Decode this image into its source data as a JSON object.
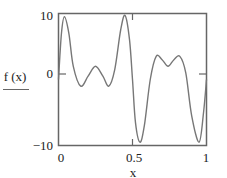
{
  "chart_data": {
    "type": "line",
    "title": "",
    "xlabel": "x",
    "ylabel": "f (x)",
    "xlim": [
      0,
      1
    ],
    "ylim": [
      -10,
      10
    ],
    "grid": false,
    "legend": null,
    "x_ticks": [
      "0",
      "0.5",
      "1"
    ],
    "y_ticks": [
      "10",
      "0",
      "-10"
    ],
    "series": [
      {
        "name": "f (x)",
        "color": "#777777",
        "x": [
          0,
          0.02,
          0.04,
          0.07,
          0.1,
          0.15,
          0.2,
          0.25,
          0.3,
          0.34,
          0.38,
          0.42,
          0.45,
          0.48,
          0.5,
          0.52,
          0.55,
          0.58,
          0.62,
          0.66,
          0.7,
          0.74,
          0.78,
          0.82,
          0.86,
          0.9,
          0.95,
          0.98,
          1.0
        ],
        "values": [
          0,
          7,
          9.5,
          7,
          2,
          -1,
          0.5,
          2,
          0.5,
          -1,
          1.5,
          7.5,
          9.7,
          6,
          0,
          -6.5,
          -9.5,
          -7,
          0,
          3.5,
          3,
          2,
          3,
          3.5,
          1,
          -5.5,
          -9.5,
          -5,
          0
        ]
      }
    ]
  },
  "labels": {
    "ylabel": "f (x)",
    "xlabel": "x",
    "y_top": "10",
    "y_mid": "0",
    "y_bottom": "−10",
    "x_left": "0",
    "x_mid": "0.5",
    "x_right": "1"
  }
}
